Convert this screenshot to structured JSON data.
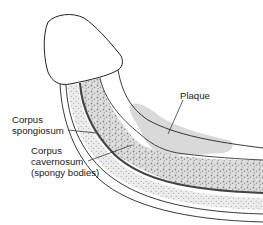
{
  "diagram": {
    "labels": {
      "plaque": "Plaque",
      "corpus_spongiosum_line1": "Corpus",
      "corpus_spongiosum_line2": "spongiosum",
      "corpus_cavernosum_line1": "Corpus",
      "corpus_cavernosum_line2": "cavernosum",
      "corpus_cavernosum_line3": "(spongy bodies)"
    },
    "colors": {
      "outline": "#1a1a1a",
      "plaque_fill": "#d9d9d9",
      "spongiosum_fill": "#e6e6e6",
      "cavernosum_fill": "#dcdcdc",
      "speckle": "#8a8a8a",
      "background": "#ffffff"
    }
  }
}
